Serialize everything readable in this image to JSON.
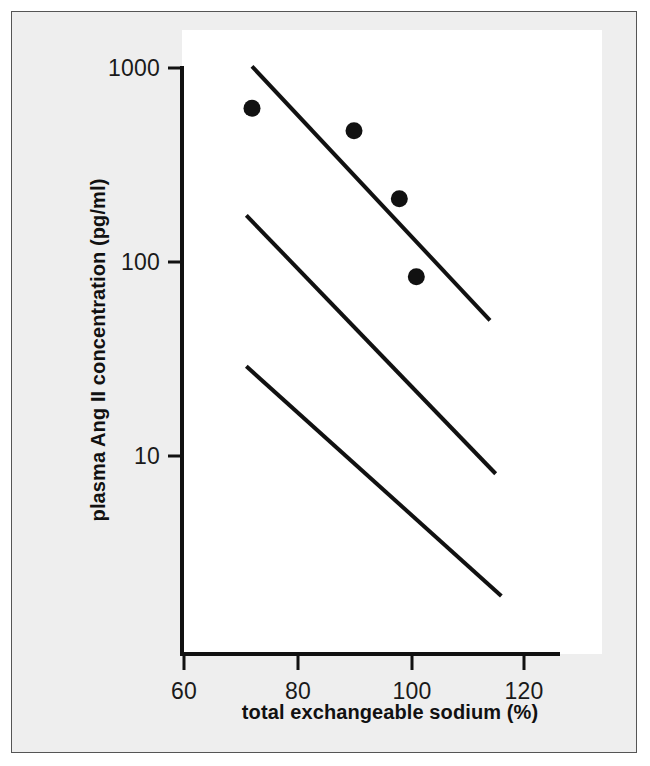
{
  "figure": {
    "background_color": "#eeeeee",
    "plot_background_color": "#ffffff",
    "ink_color": "#111111",
    "frame_color": "#555555"
  },
  "chart_data": {
    "type": "scatter",
    "title": "",
    "subtitle": "",
    "xlabel": "total exchangeable sodium (%)",
    "ylabel": "plasma Ang II concentration (pg/ml)",
    "xscale": "linear",
    "yscale": "log",
    "xlim": [
      57,
      131
    ],
    "ylim": [
      1.6,
      1000
    ],
    "grid": false,
    "legend": null,
    "xticks": [
      60,
      80,
      100,
      120
    ],
    "xticklabels": [
      "60",
      "80",
      "100",
      "120"
    ],
    "yticks": [
      10,
      100,
      1000
    ],
    "yticklabels": [
      "10",
      "100",
      "1000"
    ],
    "series": [
      {
        "name": "measured subjects",
        "type": "scatter",
        "marker": "filled-circle",
        "marker_size_px": 17,
        "color": "#111111",
        "points": [
          {
            "x": 72,
            "y": 620
          },
          {
            "x": 90,
            "y": 475
          },
          {
            "x": 98,
            "y": 212
          },
          {
            "x": 101,
            "y": 84
          }
        ]
      },
      {
        "name": "upper reference line",
        "type": "line",
        "color": "#111111",
        "points": [
          {
            "x": 72,
            "y": 1020
          },
          {
            "x": 114,
            "y": 50
          }
        ]
      },
      {
        "name": "middle reference line",
        "type": "line",
        "color": "#111111",
        "points": [
          {
            "x": 71,
            "y": 174
          },
          {
            "x": 115,
            "y": 8.1
          }
        ]
      },
      {
        "name": "lower reference line",
        "type": "line",
        "color": "#111111",
        "points": [
          {
            "x": 71,
            "y": 29
          },
          {
            "x": 116,
            "y": 1.9
          }
        ]
      }
    ],
    "annotations": []
  }
}
